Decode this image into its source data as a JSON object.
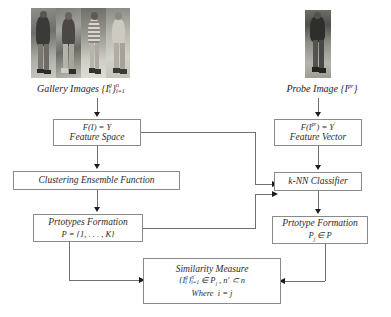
{
  "diagram": {
    "gallery": {
      "caption_text": "Gallery Images",
      "caption_symbol_base": "{I",
      "caption_sup": "g",
      "caption_sub": "i",
      "caption_close": "}",
      "caption_outer_sub": "i=1",
      "caption_outer_sup": "n",
      "caption_full": "Gallery Images {I_i^g}_{i=1}^{n}",
      "image_count": 4,
      "image_alt": "four pedestrian photographs in grayscale"
    },
    "probe": {
      "caption_text": "Probe Image",
      "caption_full": "Probe Image {I^pr}",
      "caption_symbol_base": "{I",
      "caption_sup": "pr",
      "caption_close": "}",
      "image_count": 1,
      "image_alt": "single pedestrian photograph in grayscale"
    },
    "boxes": [
      {
        "id": "feature-space",
        "line1": "F(I) = Y",
        "line2": "Feature Space",
        "line3": ""
      },
      {
        "id": "clustering-ensemble-function",
        "line1": "",
        "line2": "Clustering Ensemble Function",
        "line3": ""
      },
      {
        "id": "prototypes-formation",
        "line1": "Prtotypes Formation",
        "line2": "P = {1, . . . , K}",
        "line3": ""
      },
      {
        "id": "feature-vector",
        "line1": "F(I^pr) = Y'",
        "line2": "Feature Vector",
        "line3": ""
      },
      {
        "id": "knn-classifier",
        "line1": "",
        "line2": "k-NN Classifier",
        "line3": ""
      },
      {
        "id": "prototype-formation",
        "line1": "Prtotype Formation",
        "line2": "Pj ∈ P",
        "line3": ""
      },
      {
        "id": "similarity-measure",
        "line1": "Similarity Measure",
        "line2": "{I_i^g}_{i=1}^{n'} ∈ Pi , n' ⊂ n",
        "line3": "Where  i = j"
      }
    ],
    "labels": {
      "feature_space_formula": "F(I) = Y",
      "feature_space_name": "Feature Space",
      "clustering_ensemble": "Clustering Ensemble Function",
      "prototypes_formation_name": "Prtotypes Formation",
      "prototypes_formation_formula": "P = {1, . . . , K}",
      "feature_vector_formula_lhs": "F(I",
      "feature_vector_formula_sup": "pr",
      "feature_vector_formula_rhs": ") = Y",
      "feature_vector_formula_prime": "'",
      "feature_vector_name": "Feature Vector",
      "knn_classifier": "k-NN Classifier",
      "prototype_formation_name": "Prtotype Formation",
      "prototype_formation_formula_p": "P",
      "prototype_formation_formula_sub": "j",
      "prototype_formation_formula_rest": " ∈ P",
      "similarity_measure_name": "Similarity Measure",
      "similarity_measure_set": "{I",
      "similarity_measure_set_sub": "i",
      "similarity_measure_set_sup": "g",
      "similarity_measure_set_close": "}",
      "similarity_measure_outer_sub": "i=1",
      "similarity_measure_outer_sup": "n'",
      "similarity_measure_in": " ∈ P",
      "similarity_measure_in_sub": "i",
      "similarity_measure_tail": " , n' ⊂ n",
      "similarity_where": "Where",
      "similarity_where_eq": "i = j"
    },
    "colors": {
      "box_border": "#8a8a8a",
      "line": "#6f6f6f",
      "arrow": "#1c1c1c",
      "text": "#2b2b2b",
      "background": "#ffffff"
    }
  }
}
